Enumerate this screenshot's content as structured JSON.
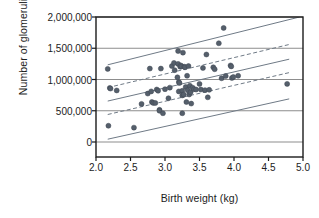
{
  "chart_data": {
    "type": "scatter",
    "title": "",
    "xlabel": "Birth weight (kg)",
    "ylabel": "Number of glomeruli",
    "xlim": [
      2.0,
      5.0
    ],
    "ylim": [
      -180000,
      2000000
    ],
    "xticks": [
      2.0,
      2.5,
      3.0,
      3.5,
      4.0,
      4.5,
      5.0
    ],
    "xticklabels": [
      "2.0",
      "2.5",
      "3.0",
      "3.5",
      "4.0",
      "4.5",
      "5.0"
    ],
    "yticks": [
      0,
      500000,
      1000000,
      1500000,
      2000000
    ],
    "yticklabels": [
      "0",
      "500,000",
      "1,000,000",
      "1,500,000",
      "2,000,000"
    ],
    "grid": "horizontal",
    "legend": "none",
    "point_color": "#555f6b",
    "line_color": "#6f7a86",
    "grid_color": "#8d8d8d",
    "frame_color": "#1c1c1c",
    "series": [
      {
        "name": "Subjects",
        "marker": "circle",
        "points": [
          [
            2.17,
            1170000
          ],
          [
            2.18,
            260000
          ],
          [
            2.2,
            865000
          ],
          [
            2.21,
            855000
          ],
          [
            2.3,
            825000
          ],
          [
            2.55,
            230000
          ],
          [
            2.66,
            610000
          ],
          [
            2.75,
            775000
          ],
          [
            2.78,
            1175000
          ],
          [
            2.8,
            810000
          ],
          [
            2.81,
            640000
          ],
          [
            2.83,
            625000
          ],
          [
            2.86,
            625000
          ],
          [
            2.88,
            840000
          ],
          [
            2.9,
            820000
          ],
          [
            2.92,
            515000
          ],
          [
            2.92,
            500000
          ],
          [
            2.94,
            1175000
          ],
          [
            2.97,
            460000
          ],
          [
            3.0,
            845000
          ],
          [
            3.05,
            700000
          ],
          [
            3.07,
            870000
          ],
          [
            3.1,
            1215000
          ],
          [
            3.13,
            1265000
          ],
          [
            3.14,
            1150000
          ],
          [
            3.18,
            1035000
          ],
          [
            3.19,
            1250000
          ],
          [
            3.19,
            1455000
          ],
          [
            3.2,
            960000
          ],
          [
            3.2,
            810000
          ],
          [
            3.21,
            945000
          ],
          [
            3.22,
            1205000
          ],
          [
            3.23,
            1225000
          ],
          [
            3.24,
            1210000
          ],
          [
            3.25,
            820000
          ],
          [
            3.25,
            745000
          ],
          [
            3.26,
            1430000
          ],
          [
            3.27,
            760000
          ],
          [
            3.28,
            1205000
          ],
          [
            3.29,
            1195000
          ],
          [
            3.3,
            880000
          ],
          [
            3.31,
            640000
          ],
          [
            3.32,
            1060000
          ],
          [
            3.33,
            830000
          ],
          [
            3.34,
            1215000
          ],
          [
            3.35,
            760000
          ],
          [
            3.36,
            900000
          ],
          [
            3.37,
            795000
          ],
          [
            3.38,
            615000
          ],
          [
            3.25,
            460000
          ],
          [
            3.4,
            870000
          ],
          [
            3.42,
            845000
          ],
          [
            3.45,
            840000
          ],
          [
            3.5,
            930000
          ],
          [
            3.52,
            840000
          ],
          [
            3.55,
            1185000
          ],
          [
            3.58,
            830000
          ],
          [
            3.6,
            1400000
          ],
          [
            3.62,
            715000
          ],
          [
            3.64,
            835000
          ],
          [
            3.7,
            1195000
          ],
          [
            3.72,
            1165000
          ],
          [
            3.78,
            1580000
          ],
          [
            3.82,
            1020000
          ],
          [
            3.85,
            1825000
          ],
          [
            3.88,
            1055000
          ],
          [
            3.95,
            1225000
          ],
          [
            3.96,
            1210000
          ],
          [
            3.97,
            1025000
          ],
          [
            3.99,
            1040000
          ],
          [
            4.06,
            1060000
          ],
          [
            4.77,
            930000
          ]
        ]
      }
    ],
    "fit_lines": [
      {
        "name": "regression-line",
        "style": "solid",
        "x": [
          2.17,
          4.8
        ],
        "y": [
          655000,
          1325000
        ]
      },
      {
        "name": "confidence-upper",
        "style": "dashed",
        "x": [
          2.17,
          4.8
        ],
        "y": [
          870000,
          1560000
        ]
      },
      {
        "name": "confidence-lower",
        "style": "dashed",
        "x": [
          2.17,
          4.8
        ],
        "y": [
          440000,
          1110000
        ]
      },
      {
        "name": "prediction-upper",
        "style": "solid",
        "x": [
          2.17,
          4.95
        ],
        "y": [
          1235000,
          2000000
        ]
      },
      {
        "name": "prediction-lower",
        "style": "solid",
        "x": [
          2.17,
          4.8
        ],
        "y": [
          45000,
          690000
        ]
      }
    ]
  }
}
